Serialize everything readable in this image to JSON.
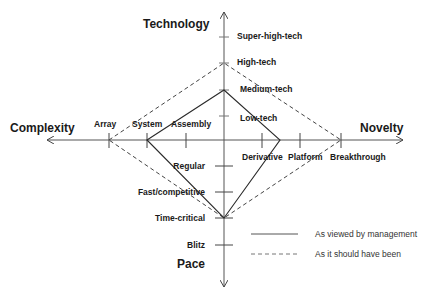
{
  "diagram": {
    "type": "diamond-framework",
    "axes": {
      "top": {
        "title": "Technology",
        "ticks": [
          "Low-tech",
          "Medium-tech",
          "High-tech",
          "Super-high-tech"
        ]
      },
      "bottom": {
        "title": "Pace",
        "ticks": [
          "Regular",
          "Fast/competitive",
          "Time-critical",
          "Blitz"
        ]
      },
      "left": {
        "title": "Complexity",
        "ticks": [
          "Assembly",
          "System",
          "Array"
        ]
      },
      "right": {
        "title": "Novelty",
        "ticks": [
          "Derivative",
          "Platform",
          "Breakthrough"
        ]
      }
    },
    "series": [
      {
        "name": "As viewed by management",
        "style": "solid",
        "points": {
          "Technology": "Medium-tech",
          "Novelty": "between Derivative and Platform",
          "Pace": "Time-critical",
          "Complexity": "System"
        }
      },
      {
        "name": "As it should have been",
        "style": "dashed",
        "points": {
          "Technology": "High-tech",
          "Novelty": "Breakthrough",
          "Pace": "Time-critical",
          "Complexity": "Array"
        }
      }
    ],
    "legend": {
      "items": [
        {
          "label": "As viewed by management",
          "style": "solid"
        },
        {
          "label": "As it should have been",
          "style": "dashed"
        }
      ]
    },
    "colors": {
      "line": "#2a2a2a",
      "axis": "#555555",
      "text": "#1a1a1a"
    }
  }
}
